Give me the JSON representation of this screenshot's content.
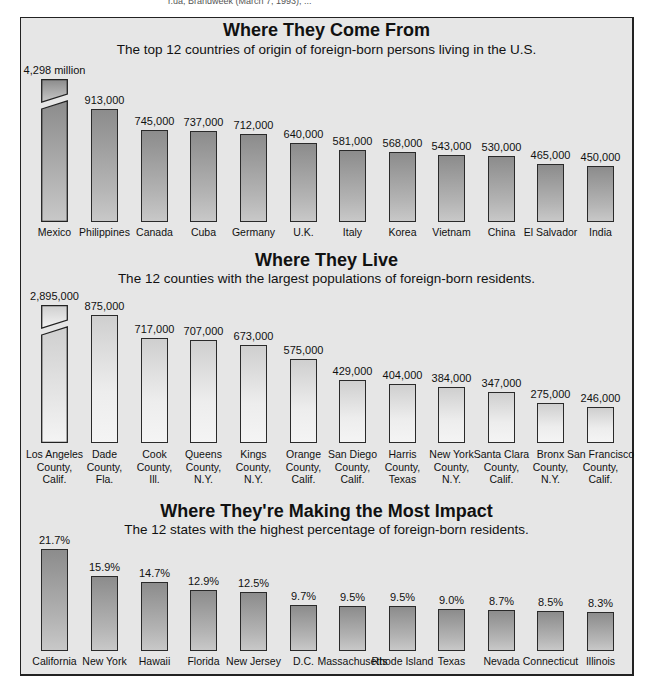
{
  "source_line": "r.ua, Brandweek (March 7, 1993), ...",
  "panels": [
    {
      "title": "Where They Come From",
      "subtitle": "The top 12 countries of origin of foreign-born persons living in the U.S."
    },
    {
      "title": "Where They Live",
      "subtitle": "The 12 counties with the largest populations of foreign-born residents."
    },
    {
      "title": "Where They're Making the Most Impact",
      "subtitle": "The 12 states with the highest percentage of foreign-born residents."
    }
  ],
  "chart_data": [
    {
      "type": "bar",
      "title": "Where They Come From",
      "subtitle": "The top 12 countries of origin of foreign-born persons living in the U.S.",
      "categories": [
        "Mexico",
        "Philippines",
        "Canada",
        "Cuba",
        "Germany",
        "U.K.",
        "Italy",
        "Korea",
        "Vietnam",
        "China",
        "El Salvador",
        "India"
      ],
      "values": [
        4298000,
        913000,
        745000,
        737000,
        712000,
        640000,
        581000,
        568000,
        543000,
        530000,
        465000,
        450000
      ],
      "value_labels": [
        "4,298 million",
        "913,000",
        "745,000",
        "737,000",
        "712,000",
        "640,000",
        "581,000",
        "568,000",
        "543,000",
        "530,000",
        "465,000",
        "450,000"
      ],
      "notes": "Mexico bar is drawn with a break (truncated axis)",
      "xlabel": "",
      "ylabel": "",
      "grid": false,
      "legend": "none"
    },
    {
      "type": "bar",
      "title": "Where They Live",
      "subtitle": "The 12 counties with the largest populations of foreign-born residents.",
      "categories": [
        [
          "Los Angeles",
          "County,",
          "Calif."
        ],
        [
          "Dade",
          "County,",
          "Fla."
        ],
        [
          "Cook",
          "County,",
          "Ill."
        ],
        [
          "Queens",
          "County,",
          "N.Y."
        ],
        [
          "Kings",
          "County,",
          "N.Y."
        ],
        [
          "Orange",
          "County,",
          "Calif."
        ],
        [
          "San Diego",
          "County,",
          "Calif."
        ],
        [
          "Harris",
          "County,",
          "Texas"
        ],
        [
          "New York",
          "County,",
          "N.Y."
        ],
        [
          "Santa Clara",
          "County,",
          "Calif."
        ],
        [
          "Bronx",
          "County,",
          "N.Y."
        ],
        [
          "San Francisco",
          "County,",
          "Calif."
        ]
      ],
      "values": [
        2895000,
        875000,
        717000,
        707000,
        673000,
        575000,
        429000,
        404000,
        384000,
        347000,
        275000,
        246000
      ],
      "value_labels": [
        "2,895,000",
        "875,000",
        "717,000",
        "707,000",
        "673,000",
        "575,000",
        "429,000",
        "404,000",
        "384,000",
        "347,000",
        "275,000",
        "246,000"
      ],
      "notes": "Los Angeles County bar is drawn with a break (truncated axis)",
      "xlabel": "",
      "ylabel": "",
      "grid": false,
      "legend": "none"
    },
    {
      "type": "bar",
      "title": "Where They're Making the Most Impact",
      "subtitle": "The 12 states with the highest percentage of foreign-born residents.",
      "categories": [
        "California",
        "New York",
        "Hawaii",
        "Florida",
        "New Jersey",
        "D.C.",
        "Massachusetts",
        "Rhode Island",
        "Texas",
        "Nevada",
        "Connecticut",
        "Illinois"
      ],
      "values": [
        21.7,
        15.9,
        14.7,
        12.9,
        12.5,
        9.7,
        9.5,
        9.5,
        9.0,
        8.7,
        8.5,
        8.3
      ],
      "value_labels": [
        "21.7%",
        "15.9%",
        "14.7%",
        "12.9%",
        "12.5%",
        "9.7%",
        "9.5%",
        "9.5%",
        "9.0%",
        "8.7%",
        "8.5%",
        "8.3%"
      ],
      "xlabel": "",
      "ylabel": "Percent foreign-born",
      "grid": false,
      "legend": "none"
    }
  ],
  "colors": {
    "panel_background": "#e6e6e6",
    "dark_bar_top": "#8c8c8c",
    "dark_bar_bottom": "#c8c8c8",
    "light_bar_top": "#cfcfcf",
    "light_bar_bottom": "#f4f4f4",
    "border": "#222222"
  }
}
